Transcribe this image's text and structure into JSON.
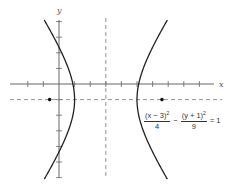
{
  "diagram": {
    "type": "hyperbola-graph",
    "axes": {
      "x_label": "x",
      "y_label": "y",
      "origin_px": [
        59,
        84
      ],
      "unit_px": 15.6,
      "x_ticks": [
        -2,
        -1,
        1,
        2,
        3,
        4,
        5,
        6,
        7,
        8,
        9
      ],
      "y_ticks": [
        -6,
        -5,
        -4,
        -3,
        -2,
        -1,
        1,
        2,
        3,
        4
      ]
    },
    "hyperbola": {
      "center": [
        3,
        -1
      ],
      "a": 2,
      "b": 3,
      "vertices": [
        [
          1,
          -1
        ],
        [
          5,
          -1
        ]
      ],
      "foci_approx": [
        [
          -0.6,
          -1
        ],
        [
          6.6,
          -1
        ]
      ],
      "t_range": [
        -6.1,
        4.1
      ]
    },
    "guides": {
      "vertical_dashed_x": 3,
      "horizontal_dashed_y": -1
    },
    "equation": {
      "term1_num": "(x − 3)",
      "term1_exp": "2",
      "term1_den": "4",
      "minus": "−",
      "term2_num": "(y + 1)",
      "term2_exp": "2",
      "term2_den": "9",
      "equals": "= 1"
    },
    "colors": {
      "curve": "#222222",
      "axis": "#666666",
      "dashed": "#777777",
      "dot": "#111111"
    }
  }
}
